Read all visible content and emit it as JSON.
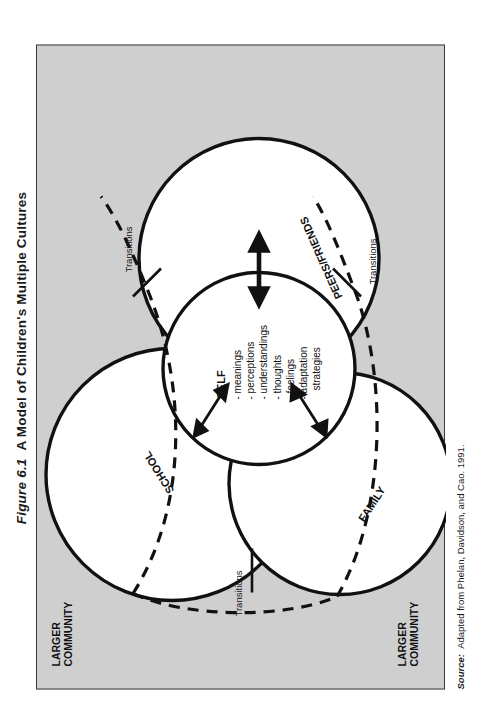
{
  "figure": {
    "number": "Figure 6.1",
    "title": "A Model of Children's Multiple Cultures",
    "source_label": "Source:",
    "source_text": "Adapted from Phelan, Davidson, and Cao. 1991."
  },
  "diagram": {
    "type": "venn-overlapping-circles",
    "background_color": "#cfcfcf",
    "circle_fill": "#ffffff",
    "stroke_color": "#111111",
    "outer_labels": [
      {
        "name": "larger-community-top",
        "line1": "LARGER",
        "line2": "COMMUNITY"
      },
      {
        "name": "larger-community-bottom",
        "line1": "LARGER",
        "line2": "COMMUNITY"
      }
    ],
    "circles": [
      {
        "name": "school",
        "label": "SCHOOL"
      },
      {
        "name": "family",
        "label": "FAMILY"
      },
      {
        "name": "peers-friends",
        "label": "PEERS/FRIENDS"
      },
      {
        "name": "self",
        "label": "SELF"
      }
    ],
    "self_attributes": [
      "- meanings",
      "- perceptions",
      "- understandings",
      "- thoughts",
      "- feelings",
      "- adaptation",
      "strategies"
    ],
    "transition_labels": [
      {
        "name": "transitions-left",
        "label": "Transitions"
      },
      {
        "name": "transitions-upper-right",
        "label": "Transitions"
      },
      {
        "name": "transitions-lower-right",
        "label": "Transitions"
      }
    ]
  }
}
